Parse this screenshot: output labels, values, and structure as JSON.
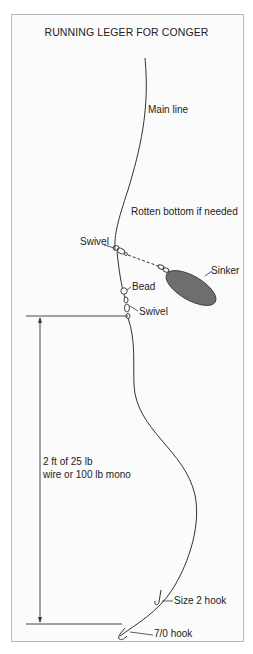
{
  "title": "RUNNING LEGER FOR CONGER",
  "labels": {
    "main_line": "Main line",
    "rotten_bottom": "Rotten bottom if needed",
    "swivel_top": "Swivel",
    "sinker": "Sinker",
    "bead": "Bead",
    "swivel_bottom": "Swivel",
    "trace_line1": "2 ft of 25 lb",
    "trace_line2": "wire or 100 lb mono",
    "size2_hook": "Size 2 hook",
    "hook_7_0": "7/0 hook"
  },
  "colors": {
    "line": "#333333",
    "sinker_fill": "#6e6e6e",
    "frame_border": "#b8b8b8"
  }
}
